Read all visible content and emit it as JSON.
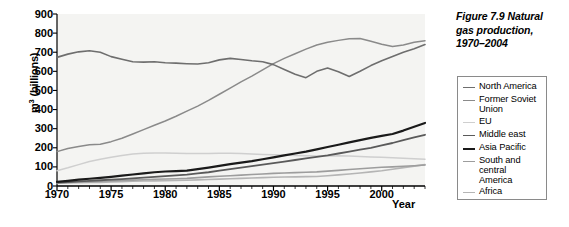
{
  "caption": {
    "line1": "Figure 7.9  Natural",
    "line2": "gas production,",
    "line3": "1970–2004",
    "full": "Figure 7.9  Natural gas production, 1970–2004"
  },
  "axes": {
    "y_title_prefix": "m",
    "y_title_sup": "3",
    "y_title_suffix": " (billions)",
    "y_title_full": "m³ (billions)",
    "x_title": "Year"
  },
  "legend": {
    "position": "right",
    "items": [
      {
        "label": "North America",
        "color": "#6e6e6e",
        "width": 1.6
      },
      {
        "label": "Former Soviet\nUnion",
        "color": "#8a8a8a",
        "width": 1.5
      },
      {
        "label": "EU",
        "color": "#cfcfcf",
        "width": 1.5
      },
      {
        "label": "Middle east",
        "color": "#5a5a5a",
        "width": 1.8
      },
      {
        "label": "Asia Pacific",
        "color": "#1a1a1a",
        "width": 2.2
      },
      {
        "label": "South and\ncentral\nAmerica",
        "color": "#9d9d9d",
        "width": 1.6
      },
      {
        "label": "Africa",
        "color": "#b5b5b5",
        "width": 1.6
      }
    ]
  },
  "chart_data": {
    "type": "line",
    "title": "Figure 7.9  Natural gas production, 1970–2004",
    "xlabel": "Year",
    "ylabel": "m³ (billions)",
    "xlim": [
      1970,
      2004
    ],
    "ylim": [
      0,
      900
    ],
    "ytick_values": [
      0,
      100,
      200,
      300,
      400,
      500,
      600,
      700,
      800,
      900
    ],
    "ytick_labels": [
      "0",
      "100",
      "200",
      "300",
      "400",
      "500",
      "600",
      "700",
      "800",
      "900"
    ],
    "xtick_values": [
      1970,
      1975,
      1980,
      1985,
      1990,
      1995,
      2000
    ],
    "xtick_labels": [
      "1970",
      "1975",
      "1980",
      "1985",
      "1990",
      "1995",
      "2000"
    ],
    "x_minor_tick_step": 1,
    "grid": false,
    "plot_background": "#f4f4f2",
    "x": [
      1970,
      1971,
      1972,
      1973,
      1974,
      1975,
      1976,
      1977,
      1978,
      1979,
      1980,
      1981,
      1982,
      1983,
      1984,
      1985,
      1986,
      1987,
      1988,
      1989,
      1990,
      1991,
      1992,
      1993,
      1994,
      1995,
      1996,
      1997,
      1998,
      1999,
      2000,
      2001,
      2002,
      2003,
      2004
    ],
    "series": [
      {
        "name": "North America",
        "color": "#6e6e6e",
        "values": [
          673,
          690,
          702,
          708,
          700,
          677,
          663,
          650,
          648,
          650,
          645,
          643,
          640,
          638,
          645,
          660,
          668,
          662,
          655,
          650,
          635,
          610,
          585,
          567,
          600,
          617,
          598,
          573,
          600,
          630,
          655,
          678,
          700,
          718,
          740
        ]
      },
      {
        "name": "Former Soviet Union",
        "color": "#8a8a8a",
        "values": [
          180,
          196,
          207,
          216,
          218,
          232,
          250,
          272,
          295,
          318,
          340,
          365,
          392,
          418,
          448,
          480,
          512,
          545,
          575,
          608,
          640,
          668,
          692,
          716,
          738,
          752,
          762,
          770,
          772,
          757,
          742,
          730,
          738,
          752,
          760
        ]
      },
      {
        "name": "EU",
        "color": "#cfcfcf",
        "values": [
          80,
          95,
          112,
          128,
          140,
          150,
          160,
          168,
          172,
          173,
          173,
          172,
          170,
          170,
          170,
          172,
          172,
          170,
          168,
          165,
          163,
          162,
          160,
          158,
          157,
          157,
          158,
          157,
          155,
          152,
          150,
          148,
          145,
          142,
          140
        ]
      },
      {
        "name": "Middle east",
        "color": "#5a5a5a",
        "values": [
          18,
          21,
          24,
          27,
          30,
          33,
          36,
          40,
          44,
          48,
          52,
          56,
          60,
          66,
          72,
          80,
          88,
          96,
          104,
          112,
          120,
          128,
          136,
          144,
          152,
          160,
          170,
          180,
          190,
          200,
          212,
          225,
          240,
          255,
          268
        ]
      },
      {
        "name": "Asia Pacific",
        "color": "#1a1a1a",
        "values": [
          22,
          27,
          33,
          38,
          43,
          48,
          54,
          60,
          66,
          72,
          76,
          78,
          80,
          88,
          96,
          105,
          114,
          122,
          130,
          140,
          150,
          160,
          170,
          180,
          192,
          204,
          216,
          228,
          240,
          252,
          262,
          272,
          290,
          310,
          330
        ]
      },
      {
        "name": "South and central America",
        "color": "#9d9d9d",
        "values": [
          17,
          19,
          21,
          23,
          25,
          27,
          29,
          31,
          33,
          35,
          37,
          38,
          40,
          44,
          48,
          51,
          54,
          57,
          60,
          63,
          66,
          68,
          70,
          72,
          74,
          78,
          82,
          86,
          90,
          94,
          98,
          100,
          103,
          106,
          110
        ]
      },
      {
        "name": "Africa",
        "color": "#b5b5b5",
        "values": [
          15,
          16,
          17,
          18,
          19,
          21,
          23,
          25,
          26,
          27,
          28,
          29,
          30,
          32,
          34,
          36,
          38,
          40,
          42,
          44,
          46,
          47,
          48,
          49,
          50,
          54,
          58,
          63,
          68,
          74,
          80,
          88,
          96,
          104,
          112
        ]
      }
    ]
  }
}
